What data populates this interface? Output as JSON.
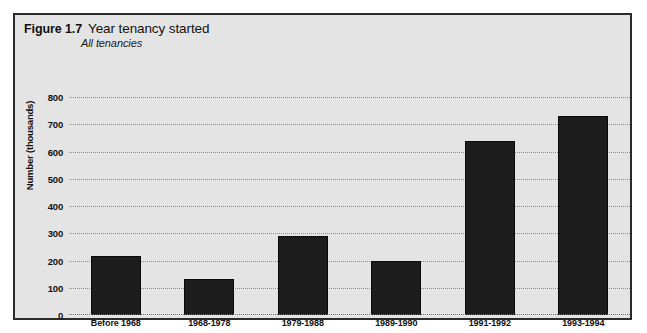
{
  "figure": {
    "number": "Figure 1.7",
    "title": "Year tenancy started",
    "subtitle": "All tenancies"
  },
  "colors": {
    "panel_background": "#e4e4e4",
    "panel_border": "#2b2b2b",
    "bar_fill": "#1c1c1c",
    "gridline": "#8b8b8b",
    "text": "#111111",
    "page_background": "#ffffff"
  },
  "chart_data": {
    "type": "bar",
    "title": "Year tenancy started",
    "subtitle": "All tenancies",
    "xlabel": "",
    "ylabel": "Number (thousands)",
    "categories": [
      "Before 1968",
      "1968-1978",
      "1979-1988",
      "1989-1990",
      "1991-1992",
      "1993-1994"
    ],
    "values": [
      218,
      132,
      290,
      200,
      640,
      730
    ],
    "ylim": [
      0,
      800
    ],
    "yticks": [
      0,
      100,
      200,
      300,
      400,
      500,
      600,
      700,
      800
    ],
    "ytick_labels": [
      "0",
      "100",
      "200",
      "300",
      "400",
      "500",
      "600",
      "700",
      "800"
    ],
    "grid": true,
    "grid_axis": "y",
    "grid_style": "dotted",
    "legend": false,
    "legend_position": "none"
  }
}
